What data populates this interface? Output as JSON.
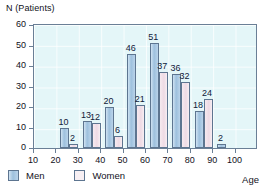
{
  "chart_data": {
    "type": "bar",
    "title": "",
    "ylabel": "N (Patients)",
    "xlabel": "Age",
    "ylim": [
      0,
      60
    ],
    "yticks": [
      0,
      10,
      20,
      30,
      40,
      50,
      60
    ],
    "xticks": [
      10,
      20,
      30,
      40,
      50,
      60,
      70,
      80,
      90,
      100
    ],
    "categories": [
      "10",
      "20",
      "30",
      "40",
      "50",
      "60",
      "70",
      "80",
      "90",
      "100"
    ],
    "grid": true,
    "legend_position": "bottom-left",
    "series": [
      {
        "name": "Men",
        "color": "#9dc0dd",
        "values": [
          null,
          10,
          13,
          20,
          46,
          51,
          36,
          18,
          2,
          null
        ]
      },
      {
        "name": "Women",
        "color": "#f0dde6",
        "values": [
          null,
          2,
          12,
          6,
          21,
          37,
          32,
          24,
          null,
          null
        ]
      }
    ],
    "plot_background": "#e4f6f8",
    "axis_color": "#6a7f96"
  },
  "legend": {
    "items": [
      {
        "label": "Men",
        "swatch": "men-swatch"
      },
      {
        "label": "Women",
        "swatch": "women-swatch"
      }
    ]
  }
}
